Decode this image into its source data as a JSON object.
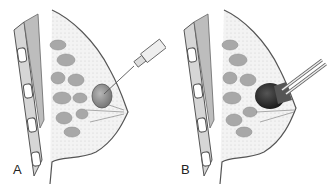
{
  "panels": [
    {
      "id": "A",
      "label": "A",
      "procedure": "needle aspiration of cyst"
    },
    {
      "id": "B",
      "label": "B",
      "procedure": "probe over mass"
    }
  ],
  "colors": {
    "outline": "#555555",
    "tissue_fill": "#ececec",
    "lobule_fill": "#a8a8a8",
    "muscle_fill": "#bdbdbd",
    "cyst_fill": "#8f8f8f",
    "probe_fill": "#1a1a1a"
  }
}
